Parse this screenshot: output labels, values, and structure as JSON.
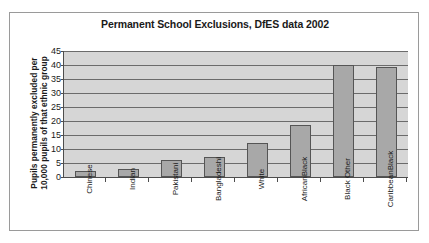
{
  "chart_data": {
    "type": "bar",
    "title": "Permanent School Exclusions, DfES data 2002",
    "xlabel": "",
    "ylabel_lines": [
      "Pupils permanently excluded per",
      "10,000 pupils of that ethnic group"
    ],
    "ylabel": "Pupils permanently excluded per 10,000 pupils of that ethnic group",
    "categories": [
      "Chinese",
      "Indian",
      "Pakistani",
      "Bangladeshi",
      "White",
      "Black African",
      "Black Other",
      "Black Caribbean"
    ],
    "category_lines": [
      [
        "Chinese"
      ],
      [
        "Indian"
      ],
      [
        "Pakistani"
      ],
      [
        "Bangladeshi"
      ],
      [
        "White"
      ],
      [
        "Black",
        "African"
      ],
      [
        "Black Other"
      ],
      [
        "Black",
        "Caribbean"
      ]
    ],
    "values": [
      2,
      3,
      6,
      7,
      12,
      18.7,
      40,
      39.2
    ],
    "ylim": [
      0,
      45
    ],
    "yticks": [
      0,
      5,
      10,
      15,
      20,
      25,
      30,
      35,
      40,
      45
    ],
    "grid": true,
    "legend": "none",
    "colors": {
      "bar_fill": "#a8a8a8",
      "bar_border": "#555555",
      "plot_background": "#d6d6d6",
      "gridline": "#6b6b6b",
      "axis": "#4d4d4d",
      "frame": "#9a9a9a",
      "text": "#1a1a1a"
    }
  }
}
